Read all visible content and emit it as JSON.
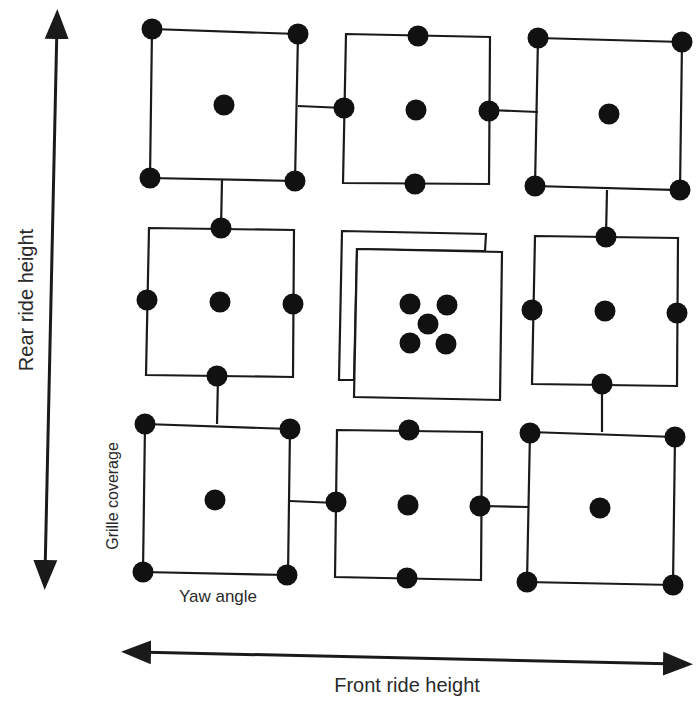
{
  "diagram": {
    "axis_vertical_label": "Rear ride height",
    "axis_horizontal_label": "Front ride height",
    "inner_vertical_label": "Grille coverage",
    "inner_horizontal_label": "Yaw angle",
    "line_color": "#1a1a1a",
    "dot_color": "#111111",
    "cells": [
      {
        "row": 0,
        "col": 0,
        "type": "corners+center",
        "box": [
          152,
          28,
          298,
          180
        ]
      },
      {
        "row": 0,
        "col": 1,
        "type": "edges+center",
        "box": [
          344,
          34,
          490,
          184
        ]
      },
      {
        "row": 0,
        "col": 2,
        "type": "corners+center",
        "box": [
          538,
          38,
          680,
          190
        ]
      },
      {
        "row": 1,
        "col": 0,
        "type": "edges+center",
        "box": [
          148,
          228,
          294,
          378
        ]
      },
      {
        "row": 1,
        "col": 1,
        "type": "center-cluster",
        "box": [
          356,
          250,
          500,
          398
        ]
      },
      {
        "row": 1,
        "col": 2,
        "type": "edges+center",
        "box": [
          534,
          236,
          678,
          386
        ]
      },
      {
        "row": 2,
        "col": 0,
        "type": "corners+center",
        "box": [
          144,
          424,
          290,
          576
        ]
      },
      {
        "row": 2,
        "col": 1,
        "type": "edges+center",
        "box": [
          336,
          430,
          482,
          580
        ]
      },
      {
        "row": 2,
        "col": 2,
        "type": "corners+center",
        "box": [
          528,
          432,
          676,
          582
        ]
      }
    ]
  }
}
